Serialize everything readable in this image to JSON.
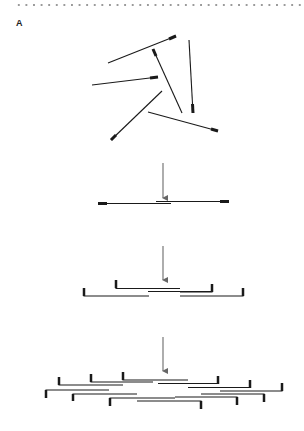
{
  "panel": {
    "label": "A"
  },
  "colors": {
    "strand": "#1a1a1a",
    "arrow": "#777777",
    "end_cap": "#111111",
    "dots": "#9a9a9a"
  },
  "stages": [
    {
      "name": "scattered-fragments",
      "description": "Randomly oriented DNA fragments with marked (thick) ends"
    },
    {
      "name": "overlapping-pair",
      "description": "Two fragments aligned with a central overlap"
    },
    {
      "name": "bracketed-assembly",
      "description": "Four bracketed fragments tiled around overlap"
    },
    {
      "name": "extended-assembly",
      "description": "Many bracketed fragments tiled into a larger contig"
    }
  ],
  "arrows": [
    {
      "x": 163,
      "y1": 163,
      "y2": 198
    },
    {
      "x": 163,
      "y1": 246,
      "y2": 280
    },
    {
      "x": 163,
      "y1": 337,
      "y2": 371
    }
  ],
  "fragments_stage1": [
    {
      "x1": 108,
      "y1": 63,
      "x2": 176,
      "y2": 36,
      "cap": "end"
    },
    {
      "x1": 182,
      "y1": 113,
      "x2": 153,
      "y2": 49,
      "cap": "end"
    },
    {
      "x1": 189,
      "y1": 40,
      "x2": 193,
      "y2": 113,
      "cap": "end"
    },
    {
      "x1": 92,
      "y1": 85,
      "x2": 158,
      "y2": 77,
      "cap": "end"
    },
    {
      "x1": 162,
      "y1": 91,
      "x2": 111,
      "y2": 140,
      "cap": "end"
    },
    {
      "x1": 148,
      "y1": 112,
      "x2": 218,
      "y2": 131,
      "cap": "end"
    }
  ]
}
